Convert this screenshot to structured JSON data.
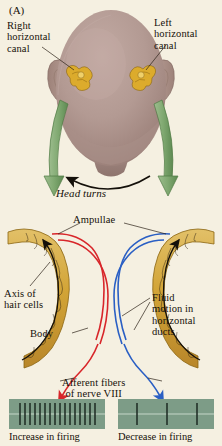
{
  "figure": {
    "panel_letter": "(A)",
    "background_color": "#f5f0e1",
    "head_color": "#b39a93",
    "organ_color": "#d8a72a",
    "duct_color": "#d4a53c",
    "arrow_green": "#7fa870",
    "fluid_left_color": "#d8262a",
    "fluid_right_color": "#2a5fc4"
  },
  "labels": {
    "right_canal": "Right\nhorizontal\ncanal",
    "left_canal": "Left\nhorizontal\ncanal",
    "head_turns": "Head turns",
    "ampullae": "Ampullae",
    "axis_of_hair_cells": "Axis of\nhair cells",
    "body": "Body",
    "fluid_motion": "Fluid\nmotion in\nhorizontal\nducts",
    "afferent_fibers": "Afferent fibers\nof nerve VIII"
  },
  "recordings": [
    {
      "side": "left",
      "caption": "Increase in firing",
      "spike_count": 16,
      "pattern": "dense",
      "panel_color": "#7d9c87",
      "spike_color": "#1d2a22",
      "baseline_color": "#c6d6c8",
      "arrow_color": "#d8262a"
    },
    {
      "side": "right",
      "caption": "Decrease in firing",
      "spike_count": 3,
      "pattern": "sparse",
      "panel_color": "#7d9c87",
      "spike_color": "#1d2a22",
      "baseline_color": "#c6d6c8",
      "arrow_color": "#2a5fc4"
    }
  ]
}
